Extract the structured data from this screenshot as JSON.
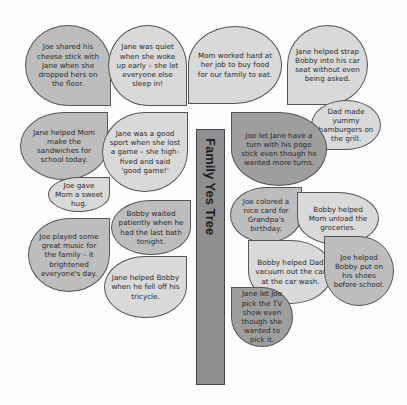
{
  "tree": {
    "title": "Family Yes Tree",
    "trunk_color": "#8f8f8f"
  },
  "colors": {
    "light": "#d9d9d9",
    "mid": "#bdbdbd",
    "dark": "#9e9e9e"
  },
  "leaves": [
    {
      "text": "Joe shared his cheese stick with Jane when she dropped hers on the floor."
    },
    {
      "text": "Jane was quiet when she woke up early – she let everyone else sleep in!"
    },
    {
      "text": "Mom worked hard at her job to buy food for our family to eat."
    },
    {
      "text": "Jane helped strap Bobby into his car seat without even being asked."
    },
    {
      "text": "Dad made yummy hamburgers on the grill."
    },
    {
      "text": "Jane helped Mom make the sandwiches for school today."
    },
    {
      "text": "Jane was a good sport when she lost a game – she high-fived and said 'good game!'"
    },
    {
      "text": "Joe gave Mom a sweet hug."
    },
    {
      "text": "Bobby waited patiently when he had the last bath tonight."
    },
    {
      "text": "Joe played some great music for the family – it brightened everyone's day."
    },
    {
      "text": "Jane helped Bobby when he fell off his tricycle."
    },
    {
      "text": "Joe let Jane have a turn with his pogo stick even though he wanted more turns."
    },
    {
      "text": "Joe colored a nice card for Grandpa's birthday."
    },
    {
      "text": "Bobby helped Mom unload the groceries."
    },
    {
      "text": "Bobby helped Dad vacuum out the car at the car wash."
    },
    {
      "text": "Joe helped Bobby put on his shoes before school."
    },
    {
      "text": "Jane let Joe pick the TV show even though she wanted to pick it."
    }
  ]
}
